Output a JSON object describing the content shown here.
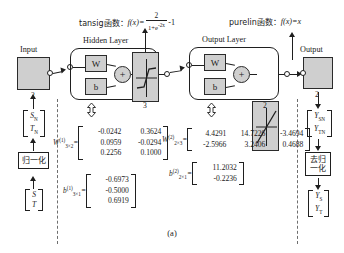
{
  "figure": {
    "caption": "(a)",
    "activation_notes": [
      {
        "name": "tansig-note",
        "prefix": "tansig函数：",
        "fn": "f(x)=",
        "numerator": "2",
        "denominator": "1+e",
        "denominator_exp": "-2x",
        "tail": "-1"
      },
      {
        "name": "purelin-note",
        "prefix": "purelin函数：",
        "fn": "f(x)=x"
      }
    ],
    "input_block": {
      "label": "Input",
      "size": "2"
    },
    "output_block": {
      "label": "Output",
      "size": "2"
    },
    "hidden_layer": {
      "title": "Hidden Layer",
      "weight_label": "W",
      "bias_label": "b",
      "sum_symbol": "+",
      "neuron_count": "3"
    },
    "output_layer": {
      "title": "Output Layer",
      "weight_label": "W",
      "bias_label": "b",
      "sum_symbol": "+",
      "neuron_count": "2"
    },
    "left_chain": {
      "normalized_vector": [
        "S",
        "T"
      ],
      "normalized_vector_sub": [
        "N",
        "N"
      ],
      "normalize_box": "归一化",
      "raw_vector": [
        "S",
        "T"
      ]
    },
    "right_chain": {
      "normalized_output_vector": [
        "Y",
        "Y"
      ],
      "normalized_output_sub": [
        "SN",
        "TN"
      ],
      "denormalize_box_line1": "去归",
      "denormalize_box_line2": "一化",
      "output_vector": [
        "Y",
        "Y"
      ],
      "output_sub": [
        "S",
        "T"
      ]
    },
    "weights": {
      "w1": {
        "label": "W",
        "sup": "(1)",
        "sub": "3×2",
        "eq": "=",
        "rows": [
          [
            "-0.0242",
            "0.3624"
          ],
          [
            "0.0959",
            "-0.0294"
          ],
          [
            "0.2256",
            "0.1000"
          ]
        ]
      },
      "w2": {
        "label": "W",
        "sup": "(2)",
        "sub": "2×3",
        "eq": "=",
        "rows": [
          [
            "4.4291",
            "14.7226",
            "-3.4694"
          ],
          [
            "-2.5966",
            "3.2406",
            "0.4688"
          ]
        ]
      },
      "b1": {
        "label": "b",
        "sup": "(1)",
        "sub": "3×1",
        "eq": "=",
        "rows": [
          [
            "-0.6973"
          ],
          [
            "-0.5000"
          ],
          [
            "0.6919"
          ]
        ]
      },
      "b2": {
        "label": "b",
        "sup": "(2)",
        "sub": "2×1",
        "eq": "=",
        "rows": [
          [
            "11.2032"
          ],
          [
            "-0.2236"
          ]
        ]
      }
    }
  }
}
